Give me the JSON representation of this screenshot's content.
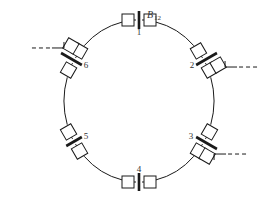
{
  "colors": {
    "line": "#1a1a1a",
    "background": "#ffffff"
  },
  "bus_label": {
    "main": "B",
    "subscript": "12"
  },
  "nodes": [
    {
      "id": "1",
      "label": "1",
      "has_feeder": false
    },
    {
      "id": "2",
      "label": "2",
      "has_feeder": true
    },
    {
      "id": "3",
      "label": "3",
      "has_feeder": true
    },
    {
      "id": "4",
      "label": "4",
      "has_feeder": false
    },
    {
      "id": "5",
      "label": "5",
      "has_feeder": false
    },
    {
      "id": "6",
      "label": "6",
      "has_feeder": true
    }
  ]
}
